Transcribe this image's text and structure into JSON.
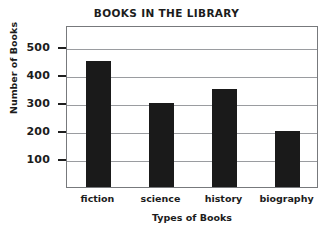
{
  "chart_data": {
    "type": "bar",
    "title": "BOOKS IN THE LIBRARY",
    "xlabel": "Types of Books",
    "ylabel": "Number of Books",
    "categories": [
      "fiction",
      "science",
      "history",
      "biography"
    ],
    "values": [
      450,
      300,
      350,
      200
    ],
    "ylim": [
      0,
      560
    ],
    "yticks": [
      100,
      200,
      300,
      400,
      500
    ],
    "ytick_labels": [
      "100",
      "200",
      "300",
      "400",
      "500"
    ],
    "grid": "horizontal",
    "legend": "none",
    "colors": {
      "bar": "#1a1a1a",
      "gridline": "#9a9ca0",
      "frame": "#77797c",
      "background": "#ffffff",
      "text": "#1c1c1c"
    }
  }
}
